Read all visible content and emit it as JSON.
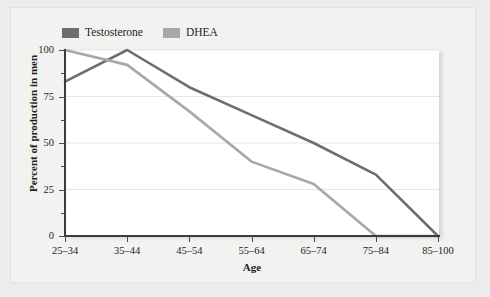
{
  "chart_data": {
    "type": "line",
    "title": "",
    "xlabel": "Age",
    "ylabel": "Percent of production in men",
    "categories": [
      "25–34",
      "35–44",
      "45–54",
      "55–64",
      "65–74",
      "75–84",
      "85–100"
    ],
    "ylim": [
      0,
      100
    ],
    "xlim": [
      0,
      6
    ],
    "yticks": [
      0,
      25,
      50,
      75,
      100
    ],
    "ytick_labels": [
      "0",
      "25",
      "50",
      "75",
      "100"
    ],
    "grid": true,
    "grid_axis": "y",
    "legend_position": "top-left",
    "series": [
      {
        "name": "Testosterone",
        "color": "#6e6e70",
        "values": [
          83,
          100,
          80,
          65,
          50,
          33,
          0
        ]
      },
      {
        "name": "DHEA",
        "color": "#a8a8aa",
        "values": [
          100,
          92,
          67,
          40,
          28,
          0,
          0
        ]
      }
    ]
  },
  "colors": {
    "page_background": "#ececed",
    "card_background": "#f2f2f1",
    "plot_background": "#ffffff",
    "axis": "#3b3b3c",
    "gridline": "#e6e6e6",
    "text": "#231f20"
  }
}
